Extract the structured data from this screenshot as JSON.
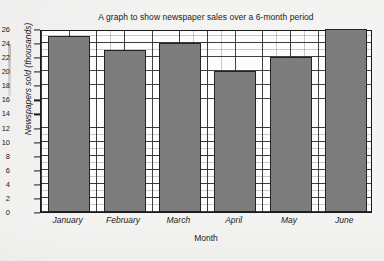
{
  "chart_data": {
    "type": "bar",
    "title": "A graph to show newspaper sales over a 6-month period",
    "xlabel": "Month",
    "ylabel": "Newspapers sold (thousands)",
    "categories": [
      "January",
      "February",
      "March",
      "April",
      "May",
      "June"
    ],
    "values": [
      25,
      23,
      24,
      20,
      22,
      26
    ],
    "ylim": [
      0,
      26
    ],
    "ytick_step": 2,
    "yticks": [
      0,
      2,
      4,
      6,
      8,
      10,
      12,
      14,
      16,
      18,
      20,
      22,
      24,
      26
    ],
    "ytick_labels": [
      "0",
      "2",
      "4",
      "6",
      "8",
      "10",
      "12",
      "14",
      "16",
      "18",
      "20",
      "22",
      "24",
      "26"
    ],
    "grid": true,
    "minor_grid": true,
    "legend": null,
    "bar_color": "#7d7d7d",
    "bar_edge_color": "#232323",
    "plot_background": "#fdfdfd",
    "page_background": "#f3f3f2"
  }
}
